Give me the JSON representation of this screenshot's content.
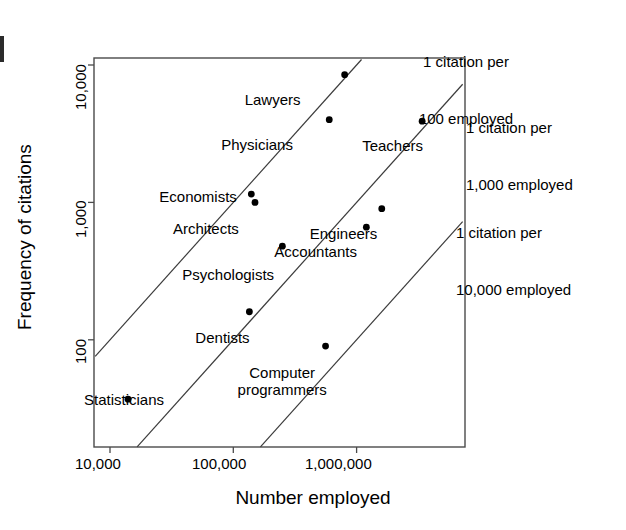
{
  "figure": {
    "background_color": "#ffffff",
    "line_color": "#000000",
    "point_color": "#000000"
  },
  "chart_data": {
    "type": "scatter",
    "title": "",
    "xlabel": "Number employed",
    "ylabel": "Frequency of citations",
    "xscale": "log",
    "yscale": "log",
    "grid": false,
    "legend": "none",
    "xticks": [
      "10,000",
      "100,000",
      "1,000,000"
    ],
    "xtick_values": [
      10000,
      100000,
      1000000
    ],
    "yticks": [
      "10,000",
      "1,000",
      "100"
    ],
    "ytick_values": [
      10000,
      1000,
      100
    ],
    "xlim": [
      6800,
      5200000
    ],
    "ylim": [
      28,
      17000
    ],
    "points": [
      {
        "label": "Lawyers",
        "x": 800000,
        "y": 8500,
        "label_dx": -100,
        "label_dy": 16
      },
      {
        "label": "Physicians",
        "x": 600000,
        "y": 4000,
        "label_dx": -108,
        "label_dy": 16
      },
      {
        "label": "Teachers",
        "x": 3400000,
        "y": 3900,
        "label_dx": -60,
        "label_dy": 16
      },
      {
        "label": "Economists",
        "x": 140000,
        "y": 1150,
        "label_dx": -92,
        "label_dy": -6
      },
      {
        "label": "Architects",
        "x": 150000,
        "y": 1000,
        "label_dx": -82,
        "label_dy": 18
      },
      {
        "label": "Engineers",
        "x": 1600000,
        "y": 900,
        "label_dx": -72,
        "label_dy": 16
      },
      {
        "label": "Accountants",
        "x": 1200000,
        "y": 660,
        "label_dx": -92,
        "label_dy": 16
      },
      {
        "label": "Psychologists",
        "x": 250000,
        "y": 480,
        "label_dx": -100,
        "label_dy": 20
      },
      {
        "label": "Dentists",
        "x": 135000,
        "y": 160,
        "label_dx": -54,
        "label_dy": 17
      },
      {
        "label": "Computer\nprogrammers",
        "x": 560000,
        "y": 90,
        "label_dx": -88,
        "label_dy": 18
      },
      {
        "label": "Statisticians",
        "x": 14000,
        "y": 37,
        "label_dx": -44,
        "label_dy": -8
      }
    ],
    "reference_lines": [
      {
        "name": "1 citation per 100 employed",
        "ratio": 0.01,
        "annotation": "1 citation per\n100 employed"
      },
      {
        "name": "1 citation per 1,000 employed",
        "ratio": 0.001,
        "annotation": "1 citation per\n1,000 employed"
      },
      {
        "name": "1 citation per 10,000 employed",
        "ratio": 0.0001,
        "annotation": "1 citation per\n10,000 employed"
      }
    ]
  },
  "annotations": {
    "line1_text1": "1 citation per",
    "line1_text2": "100 employed",
    "line2_text1": "1 citation per",
    "line2_text2": "1,000 employed",
    "line3_text1": "1 citation per",
    "line3_text2": "10,000 employed"
  },
  "axes": {
    "x_title": "Number employed",
    "y_title": "Frequency of citations",
    "x_tick_0": "10,000",
    "x_tick_1": "100,000",
    "x_tick_2": "1,000,000",
    "y_tick_0": "10,000",
    "y_tick_1": "1,000",
    "y_tick_2": "100"
  },
  "point_labels": {
    "lawyers": "Lawyers",
    "physicians": "Physicians",
    "teachers": "Teachers",
    "economists": "Economists",
    "architects": "Architects",
    "engineers": "Engineers",
    "accountants": "Accountants",
    "psychologists": "Psychologists",
    "dentists": "Dentists",
    "computer_programmers_line1": "Computer",
    "computer_programmers_line2": "programmers",
    "statisticians": "Statisticians"
  }
}
